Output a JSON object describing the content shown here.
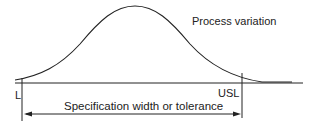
{
  "diagram": {
    "curve_label": "Process variation",
    "lower_limit_label": "L",
    "upper_limit_label": "USL",
    "span_label": "Specification width or tolerance"
  },
  "colors": {
    "line": "#222222",
    "background": "#ffffff"
  }
}
